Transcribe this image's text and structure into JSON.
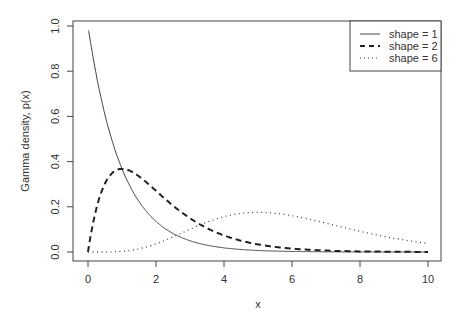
{
  "chart_data": {
    "type": "line",
    "title": "",
    "xlabel": "x",
    "ylabel": "Gamma density, p(x)",
    "xlim": [
      0,
      10
    ],
    "ylim": [
      0,
      1.0
    ],
    "x_ticks": [
      "0",
      "2",
      "4",
      "6",
      "8",
      "10"
    ],
    "y_ticks": [
      "0.0",
      "0.2",
      "0.4",
      "0.6",
      "0.8",
      "1.0"
    ],
    "grid": false,
    "legend_position": "top-right",
    "series": [
      {
        "name": "shape = 1",
        "style": "solid",
        "shape": 1,
        "rate": 1,
        "x": [
          0,
          1,
          2,
          3,
          4,
          5,
          6,
          8,
          10
        ],
        "values": [
          1.0,
          0.37,
          0.14,
          0.05,
          0.02,
          0.007,
          0.002,
          0.0,
          0.0
        ]
      },
      {
        "name": "shape = 2",
        "style": "dashed",
        "shape": 2,
        "rate": 1,
        "x": [
          0,
          1,
          2,
          3,
          4,
          5,
          6,
          8,
          10
        ],
        "values": [
          0.0,
          0.37,
          0.27,
          0.15,
          0.07,
          0.03,
          0.015,
          0.003,
          0.0
        ]
      },
      {
        "name": "shape = 6",
        "style": "dotted",
        "shape": 6,
        "rate": 1,
        "x": [
          0,
          1,
          2,
          3,
          4,
          5,
          6,
          8,
          10
        ],
        "values": [
          0.0,
          0.003,
          0.036,
          0.1,
          0.156,
          0.175,
          0.161,
          0.092,
          0.038
        ]
      }
    ]
  },
  "legend": {
    "items": [
      "shape = 1",
      "shape = 2",
      "shape = 6"
    ]
  },
  "axes": {
    "xlabel": "x",
    "ylabel": "Gamma density, p(x)",
    "x_ticks": [
      "0",
      "2",
      "4",
      "6",
      "8",
      "10"
    ],
    "y_ticks": [
      "0.0",
      "0.2",
      "0.4",
      "0.6",
      "0.8",
      "1.0"
    ]
  }
}
